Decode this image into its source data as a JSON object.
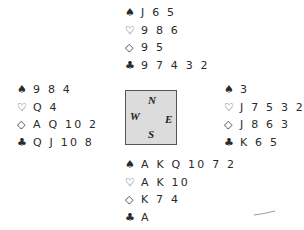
{
  "hands": {
    "north": {
      "spades": "J 6 5",
      "hearts": "9 8 6",
      "diamonds": "9 5",
      "clubs": "9 7 4 3 2"
    },
    "west": {
      "spades": "9 8 4",
      "hearts": "Q 4",
      "diamonds": "A Q 10 2",
      "clubs": "Q J 10 8"
    },
    "east": {
      "spades": "3",
      "hearts": "J 7 5 3 2",
      "diamonds": "J 8 6 3",
      "clubs": "K 6 5"
    },
    "south": {
      "spades": "A K Q 10 7 2",
      "hearts": "A K 10",
      "diamonds": "K 7 4",
      "clubs": "A"
    }
  },
  "suits": {
    "spades": "♠",
    "hearts": "♡",
    "diamonds": "◇",
    "clubs": "♣"
  },
  "compass": {
    "n": "N",
    "w": "W",
    "e": "E",
    "s": "S"
  }
}
